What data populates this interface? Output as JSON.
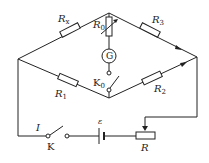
{
  "diagram": {
    "type": "Wheatstone bridge circuit",
    "labels": {
      "rx": "R",
      "rx_sub": "x",
      "r0": "R",
      "r0_sub": "0",
      "r1": "R",
      "r1_sub": "1",
      "r2": "R",
      "r2_sub": "2",
      "r3": "R",
      "r3_sub": "3",
      "galvanometer": "G",
      "k0": "K",
      "k0_sub": "0",
      "k": "K",
      "current": "I",
      "emf": "ε",
      "rheostat": "R"
    },
    "stroke_color": "#222222",
    "background": "#ffffff"
  }
}
